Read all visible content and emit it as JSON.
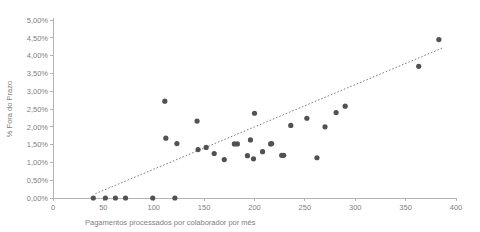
{
  "chart_data": {
    "type": "scatter",
    "title": "",
    "xlabel": "Pagamentos processados por colaborador por mês",
    "ylabel": "% Fora do Prazo",
    "xlim": [
      0,
      400
    ],
    "ylim": [
      0,
      0.05
    ],
    "grid": false,
    "legend": false,
    "xticks": [
      0,
      50,
      100,
      150,
      200,
      250,
      300,
      350,
      400
    ],
    "xtick_labels": [
      "0",
      "50",
      "100",
      "150",
      "200",
      "250",
      "300",
      "350",
      "400"
    ],
    "yticks": [
      0,
      0.005,
      0.01,
      0.015,
      0.02,
      0.025,
      0.03,
      0.035,
      0.04,
      0.045,
      0.05
    ],
    "ytick_labels": [
      "0,00%",
      "0,50%",
      "1,00%",
      "1,50%",
      "2,00%",
      "2,50%",
      "3,00%",
      "3,50%",
      "4,00%",
      "4,50%",
      "5,00%"
    ],
    "marker_color": "#525252",
    "trendline_color": "#808080",
    "axis_color": "#b3b3b3",
    "points": [
      {
        "x": 40,
        "y": 0.0
      },
      {
        "x": 52,
        "y": 0.0
      },
      {
        "x": 62,
        "y": 0.0
      },
      {
        "x": 72,
        "y": 0.0
      },
      {
        "x": 99,
        "y": 0.0
      },
      {
        "x": 121,
        "y": 0.0
      },
      {
        "x": 111,
        "y": 0.0272
      },
      {
        "x": 112,
        "y": 0.0168
      },
      {
        "x": 143,
        "y": 0.0216
      },
      {
        "x": 123,
        "y": 0.0153
      },
      {
        "x": 144,
        "y": 0.0136
      },
      {
        "x": 152,
        "y": 0.0142
      },
      {
        "x": 160,
        "y": 0.0125
      },
      {
        "x": 170,
        "y": 0.0108
      },
      {
        "x": 180,
        "y": 0.0152
      },
      {
        "x": 183,
        "y": 0.0152
      },
      {
        "x": 193,
        "y": 0.0119
      },
      {
        "x": 196,
        "y": 0.0163
      },
      {
        "x": 199,
        "y": 0.011
      },
      {
        "x": 200,
        "y": 0.0238
      },
      {
        "x": 208,
        "y": 0.013
      },
      {
        "x": 216,
        "y": 0.0152
      },
      {
        "x": 217,
        "y": 0.0153
      },
      {
        "x": 227,
        "y": 0.012
      },
      {
        "x": 229,
        "y": 0.012
      },
      {
        "x": 236,
        "y": 0.0204
      },
      {
        "x": 252,
        "y": 0.0224
      },
      {
        "x": 262,
        "y": 0.0113
      },
      {
        "x": 270,
        "y": 0.02
      },
      {
        "x": 281,
        "y": 0.024
      },
      {
        "x": 290,
        "y": 0.0258
      },
      {
        "x": 363,
        "y": 0.037
      },
      {
        "x": 383,
        "y": 0.0445
      }
    ],
    "trendline": {
      "x_start": 42,
      "y_start": 0.0012,
      "x_end": 387,
      "y_end": 0.0422
    }
  }
}
